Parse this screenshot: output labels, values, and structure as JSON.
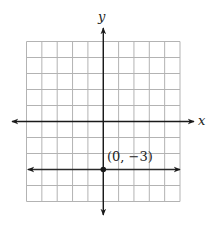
{
  "chart": {
    "x_axis_label": "x",
    "y_axis_label": "y",
    "point_label": "(0, −3)"
  },
  "chart_data": {
    "type": "line",
    "title": "",
    "xlabel": "x",
    "ylabel": "y",
    "xlim": [
      -5,
      5
    ],
    "ylim": [
      -5,
      5
    ],
    "grid": true,
    "grid_cells": 10,
    "series": [
      {
        "name": "y = -3",
        "x": [
          -5,
          5
        ],
        "y": [
          -3,
          -3
        ],
        "arrows": "both"
      }
    ],
    "points": [
      {
        "x": 0,
        "y": -3,
        "label": "(0, −3)"
      }
    ],
    "colors": {
      "grid": "#b3b3b3",
      "axes": "#1a1a1a",
      "line": "#2a2a2a"
    }
  }
}
